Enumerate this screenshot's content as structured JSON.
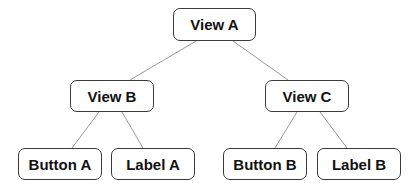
{
  "diagram": {
    "type": "tree",
    "nodes": [
      {
        "id": "view-a",
        "label": "View A",
        "x": 173,
        "y": 8,
        "w": 83,
        "h": 33
      },
      {
        "id": "view-b",
        "label": "View B",
        "x": 70,
        "y": 80,
        "w": 84,
        "h": 32
      },
      {
        "id": "view-c",
        "label": "View C",
        "x": 265,
        "y": 80,
        "w": 84,
        "h": 32
      },
      {
        "id": "button-a",
        "label": "Button A",
        "x": 18,
        "y": 148,
        "w": 84,
        "h": 32
      },
      {
        "id": "label-a",
        "label": "Label A",
        "x": 111,
        "y": 148,
        "w": 84,
        "h": 32
      },
      {
        "id": "button-b",
        "label": "Button B",
        "x": 223,
        "y": 148,
        "w": 84,
        "h": 32
      },
      {
        "id": "label-b",
        "label": "Label B",
        "x": 317,
        "y": 148,
        "w": 84,
        "h": 32
      }
    ],
    "edges": [
      {
        "from": "view-a",
        "to": "view-b"
      },
      {
        "from": "view-a",
        "to": "view-c"
      },
      {
        "from": "view-b",
        "to": "button-a"
      },
      {
        "from": "view-b",
        "to": "label-a"
      },
      {
        "from": "view-c",
        "to": "button-b"
      },
      {
        "from": "view-c",
        "to": "label-b"
      }
    ],
    "colors": {
      "edge": "#9a9a9a",
      "border": "#3a3a3a",
      "text": "#111111",
      "background": "#ffffff"
    }
  }
}
